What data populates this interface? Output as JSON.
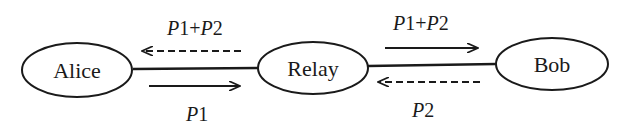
{
  "nodes": {
    "alice": {
      "label": "Alice"
    },
    "relay": {
      "label": "Relay"
    },
    "bob": {
      "label": "Bob"
    }
  },
  "edges": {
    "alice_relay": {
      "top_label": {
        "p_a": "P",
        "n_a": "1",
        "plus": "+",
        "p_b": "P",
        "n_b": "2"
      },
      "top_arrow": "dashed-left",
      "bottom_label": {
        "p": "P",
        "n": "1"
      },
      "bottom_arrow": "solid-right"
    },
    "relay_bob": {
      "top_label": {
        "p_a": "P",
        "n_a": "1",
        "plus": "+",
        "p_b": "P",
        "n_b": "2"
      },
      "top_arrow": "solid-right",
      "bottom_label": {
        "p": "P",
        "n": "2"
      },
      "bottom_arrow": "dashed-left"
    }
  },
  "colors": {
    "stroke": "#1a1a1a",
    "background": "#ffffff"
  }
}
